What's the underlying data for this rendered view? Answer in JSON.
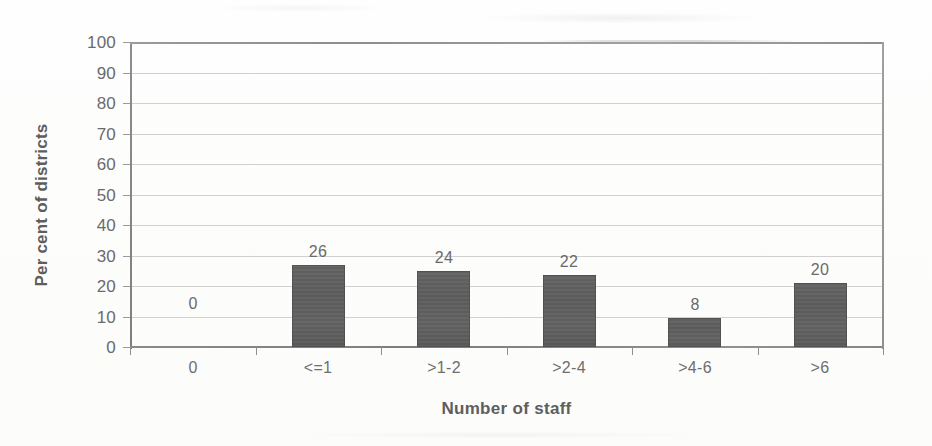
{
  "chart_data": {
    "type": "bar",
    "title": "",
    "xlabel": "Number of staff",
    "ylabel": "Per cent of districts",
    "categories": [
      "0",
      "<=1",
      ">1-2",
      ">2-4",
      ">4-6",
      ">6"
    ],
    "values": [
      0,
      26,
      24,
      22,
      8,
      20
    ],
    "data_labels": [
      "0",
      "26",
      "24",
      "22",
      "8",
      "20"
    ],
    "bar_rendered_heights": [
      0,
      27,
      25,
      23.5,
      9.5,
      21
    ],
    "ylim": [
      0,
      100
    ],
    "ytick_step": 10,
    "yticks": [
      "0",
      "10",
      "20",
      "30",
      "40",
      "50",
      "60",
      "70",
      "80",
      "90",
      "100"
    ],
    "grid": true,
    "grid_axis": "y",
    "legend": "none",
    "series": [
      {
        "name": "Per cent of districts",
        "values": [
          0,
          26,
          24,
          22,
          8,
          20
        ]
      }
    ]
  },
  "colors": {
    "bar_fill": "#5e5e5e",
    "gridline": "#9b9b9b",
    "axis": "#8a8a8a",
    "text": "#6b6b6b",
    "title_text": "#5e5e5e",
    "background": "#fdfdfc"
  }
}
